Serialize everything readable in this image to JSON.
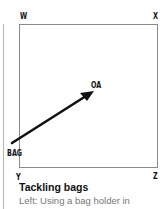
{
  "diagram": {
    "corners": {
      "top_left": "W",
      "top_right": "X",
      "bottom_left": "Y",
      "bottom_right": "Z"
    },
    "target_label": "OA",
    "origin_label": "BAG",
    "arrow": {
      "from": "BAG",
      "to": "OA",
      "color": "#111111"
    }
  },
  "caption": {
    "title": "Tackling bags",
    "body": "Left: Using a bag holder in"
  },
  "colors": {
    "box_border": "#8a8a8a",
    "side_rule": "#b5b5b5",
    "caption_body": "#777777"
  }
}
